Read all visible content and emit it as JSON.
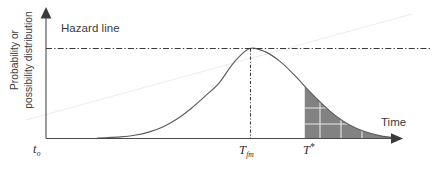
{
  "figure": {
    "width": 435,
    "height": 171,
    "background": "#ffffff"
  },
  "axes": {
    "y_axis_label_line1": "Probability or",
    "y_axis_label_line2": "possibility distribution",
    "x_axis_label": "Time",
    "origin_tick_label": "t",
    "origin_tick_sub": "o",
    "peak_tick_label": "T",
    "peak_tick_sub": "fm",
    "threshold_tick_label": "T",
    "threshold_tick_sup": "*"
  },
  "annotations": {
    "hazard_line_label": "Hazard line"
  },
  "colors": {
    "axis": "#4a4a4a",
    "curve": "#5c5c5c",
    "hazard": "#3a3a3a",
    "marker": "#3a3a3a",
    "shade_fill": "#828282",
    "shade_grid": "#f2f2f2",
    "text": "#3b3b3b",
    "background": "#ffffff"
  },
  "chart_data": {
    "type": "line",
    "title": "",
    "subtitle": "",
    "xlabel": "Time",
    "ylabel": "Probability or possibility distribution",
    "xlim": [
      0,
      1
    ],
    "ylim": [
      0,
      1.08
    ],
    "grid": false,
    "legend": null,
    "curve_name": "probability / possibility distribution",
    "distribution": {
      "shape": "bell",
      "peak_x": 0.575,
      "peak_y": 1.0,
      "sigma_x": 0.148,
      "start_x": 0.167,
      "end_x": 0.988
    },
    "x": [
      0.167,
      0.21,
      0.25,
      0.29,
      0.33,
      0.37,
      0.41,
      0.45,
      0.49,
      0.53,
      0.575,
      0.62,
      0.66,
      0.7,
      0.735,
      0.775,
      0.815,
      0.855,
      0.9,
      0.945,
      0.988
    ],
    "y": [
      0.003,
      0.012,
      0.031,
      0.066,
      0.124,
      0.212,
      0.33,
      0.47,
      0.62,
      0.84,
      1.0,
      0.962,
      0.859,
      0.71,
      0.56,
      0.4,
      0.258,
      0.152,
      0.072,
      0.024,
      0.003
    ],
    "reference_lines": [
      {
        "name": "hazard-line",
        "orientation": "horizontal",
        "value": 1.0,
        "label": "Hazard line",
        "style": "dash-dot",
        "color": "#3a3a3a"
      },
      {
        "name": "tfm-marker",
        "orientation": "vertical",
        "value": 0.575,
        "label": "T_fm",
        "style": "dash-dot",
        "color": "#3a3a3a"
      }
    ],
    "shaded_area": {
      "name": "tail-beta-region",
      "from_x": 0.731,
      "to_x": 0.988,
      "fill": "#828282",
      "hatch": "grid",
      "description": "area under the curve to the right of T*"
    },
    "annotations": [
      {
        "text": "Hazard line",
        "x": 0.05,
        "y": 1.06
      },
      {
        "text": "Time",
        "x": 0.95,
        "y": 0.145
      },
      {
        "text": "t_o",
        "x": 0.0,
        "y": -0.06
      },
      {
        "text": "T_fm",
        "x": 0.575,
        "y": -0.06
      },
      {
        "text": "T*",
        "x": 0.731,
        "y": -0.06
      }
    ]
  }
}
